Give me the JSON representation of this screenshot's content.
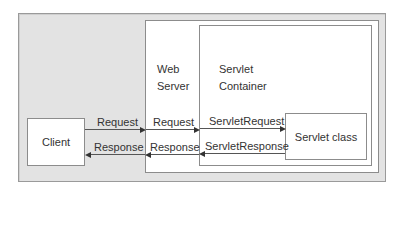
{
  "diagram": {
    "containers": {
      "web_server": {
        "line1": "Web",
        "line2": "Server"
      },
      "servlet_container": {
        "line1": "Servlet",
        "line2": "Container"
      }
    },
    "nodes": {
      "client": "Client",
      "servlet_class": "Servlet class"
    },
    "edges": {
      "client_to_web_request": "Request",
      "web_to_client_response": "Response",
      "web_to_container_request": "Request",
      "container_to_web_response": "Response",
      "container_to_servlet_request": "ServletRequest",
      "servlet_to_container_response": "ServletResponse"
    },
    "colors": {
      "background_panel": "#e3e3e3",
      "box_fill": "#ffffff",
      "border": "#8c8c8c",
      "text": "#333333"
    }
  }
}
